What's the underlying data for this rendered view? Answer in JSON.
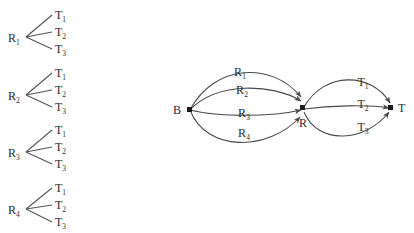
{
  "figure": {
    "background_color": "#ffffff",
    "line_color": "#555555",
    "arc_color": "#4a4a4a",
    "node_color": "#1a1a1a",
    "text_color": "#2b2b2b"
  },
  "left_panel": {
    "name": "tree-group-column",
    "trees": [
      {
        "root": "R",
        "root_sub": "1",
        "leaves": [
          {
            "label": "T",
            "sub": "1"
          },
          {
            "label": "T",
            "sub": "2"
          },
          {
            "label": "T",
            "sub": "3"
          }
        ]
      },
      {
        "root": "R",
        "root_sub": "2",
        "leaves": [
          {
            "label": "T",
            "sub": "1"
          },
          {
            "label": "T",
            "sub": "2"
          },
          {
            "label": "T",
            "sub": "3"
          }
        ]
      },
      {
        "root": "R",
        "root_sub": "3",
        "leaves": [
          {
            "label": "T",
            "sub": "1"
          },
          {
            "label": "T",
            "sub": "2"
          },
          {
            "label": "T",
            "sub": "3"
          }
        ]
      },
      {
        "root": "R",
        "root_sub": "4",
        "leaves": [
          {
            "label": "T",
            "sub": "1"
          },
          {
            "label": "T",
            "sub": "2"
          },
          {
            "label": "T",
            "sub": "3"
          }
        ]
      }
    ]
  },
  "right_panel": {
    "name": "multigraph",
    "nodes": [
      {
        "id": "B",
        "label": "B"
      },
      {
        "id": "R",
        "label": "R"
      },
      {
        "id": "T",
        "label": "T"
      }
    ],
    "edges_left": [
      {
        "from": "B",
        "to": "R",
        "label": "R",
        "sub": "1"
      },
      {
        "from": "B",
        "to": "R",
        "label": "R",
        "sub": "2"
      },
      {
        "from": "B",
        "to": "R",
        "label": "R",
        "sub": "3"
      },
      {
        "from": "B",
        "to": "R",
        "label": "R",
        "sub": "4"
      }
    ],
    "edges_right": [
      {
        "from": "R",
        "to": "T",
        "label": "T",
        "sub": "1"
      },
      {
        "from": "R",
        "to": "T",
        "label": "T",
        "sub": "2"
      },
      {
        "from": "R",
        "to": "T",
        "label": "T",
        "sub": "3"
      }
    ]
  }
}
